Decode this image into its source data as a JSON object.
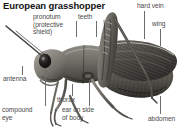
{
  "figure": {
    "title": "European grasshopper",
    "style": "grayscale halftone engraving",
    "background_color": "#ffffff",
    "title_color": "#141414",
    "label_color": "#4a4a4a",
    "leader_color": "#6d6d6d",
    "labels": [
      {
        "id": "pronotum",
        "text": "pronotum\n(protective\nshield)",
        "x": 33,
        "y": 13,
        "align": "left"
      },
      {
        "id": "teeth",
        "text": "teeth",
        "x": 78,
        "y": 13,
        "align": "left"
      },
      {
        "id": "hard-vein",
        "text": "hard vein",
        "x": 137,
        "y": 2,
        "align": "left"
      },
      {
        "id": "wing",
        "text": "wing",
        "x": 152,
        "y": 20,
        "align": "left"
      },
      {
        "id": "antenna",
        "text": "antenna",
        "x": 3,
        "y": 75,
        "align": "left"
      },
      {
        "id": "thorax",
        "text": "thorax",
        "x": 57,
        "y": 96,
        "align": "left"
      },
      {
        "id": "compound-eye",
        "text": "compound\neye",
        "x": 2,
        "y": 106,
        "align": "left"
      },
      {
        "id": "ear",
        "text": "ear on side\nof body",
        "x": 62,
        "y": 106,
        "align": "left"
      },
      {
        "id": "abdomen",
        "text": "abdomen",
        "x": 148,
        "y": 115,
        "align": "left"
      }
    ]
  }
}
